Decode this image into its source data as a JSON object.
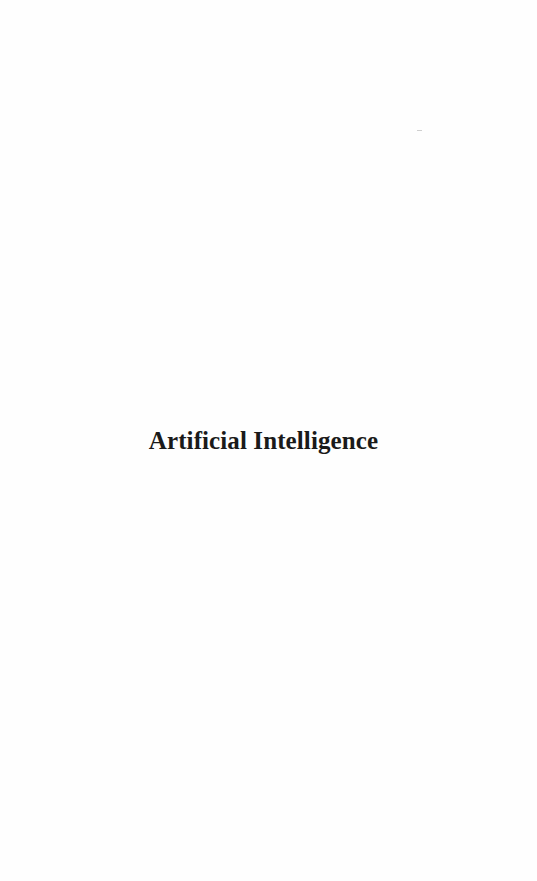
{
  "page": {
    "title": "Artificial Intelligence"
  }
}
